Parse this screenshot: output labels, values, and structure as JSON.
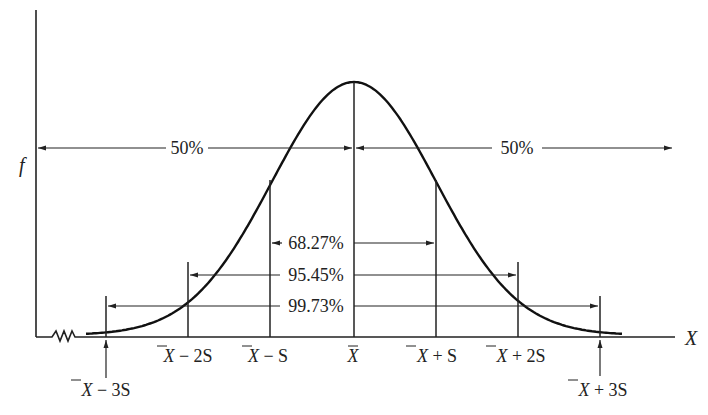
{
  "diagram": {
    "title": "",
    "y_axis_label": "f",
    "x_axis_label": "X",
    "ticks": [
      {
        "id": "m3",
        "label_main": "X",
        "label_rest": " − 3S",
        "sd": -3
      },
      {
        "id": "m2",
        "label_main": "X",
        "label_rest": " − 2S",
        "sd": -2
      },
      {
        "id": "m1",
        "label_main": "X",
        "label_rest": " − S",
        "sd": -1
      },
      {
        "id": "mean",
        "label_main": "X",
        "label_rest": "",
        "sd": 0
      },
      {
        "id": "p1",
        "label_main": "X",
        "label_rest": " + S",
        "sd": 1
      },
      {
        "id": "p2",
        "label_main": "X",
        "label_rest": " + 2S",
        "sd": 2
      },
      {
        "id": "p3",
        "label_main": "X",
        "label_rest": " + 3S",
        "sd": 3
      }
    ],
    "intervals": [
      {
        "id": "half-left",
        "label": "50%",
        "from": "axis",
        "to": "mean"
      },
      {
        "id": "half-right",
        "label": "50%",
        "from": "mean",
        "to": "right"
      },
      {
        "id": "one-sd",
        "label": "68.27%",
        "from_sd": -1,
        "to_sd": 1
      },
      {
        "id": "two-sd",
        "label": "95.45%",
        "from_sd": -2,
        "to_sd": 2
      },
      {
        "id": "three-sd",
        "label": "99.73%",
        "from_sd": -3,
        "to_sd": 3
      }
    ],
    "colors": {
      "ink": "#222222",
      "background": "#ffffff"
    }
  }
}
